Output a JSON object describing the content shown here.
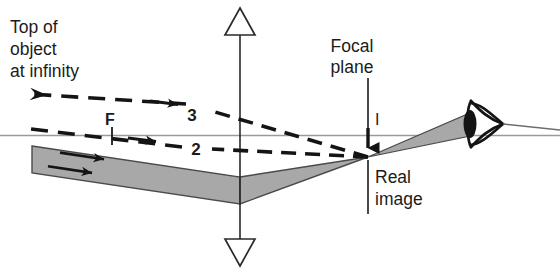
{
  "figure": {
    "title_text_lines": [
      "Top of",
      "object",
      "at infinity"
    ],
    "background_color": "#ffffff",
    "ink_color": "#1b1b1b",
    "beam_fill_color": "#a8a8a8",
    "beam_edge_color": "#4a4a4a",
    "axis_color": "#9a9a9a"
  },
  "labels": {
    "object_line_1": "Top of",
    "object_line_2": "object",
    "object_line_3": "at infinity",
    "focal_plane_line_1": "Focal",
    "focal_plane_line_2": "plane",
    "image_point": "I",
    "focal_point": "F",
    "ray_three": "3",
    "ray_two": "2",
    "real_image_line_1": "Real",
    "real_image_line_2": "image"
  },
  "elements": {
    "lens_name": "converging-lens",
    "eye_name": "eye",
    "optical_axis_name": "optical-axis",
    "beam_name": "light-beam",
    "ray_three_name": "dashed-ray-3",
    "ray_two_name": "dashed-ray-2"
  }
}
